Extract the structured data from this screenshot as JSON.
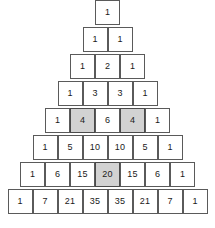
{
  "figure": {
    "name": "pascals-triangle",
    "cell_fill": "#ffffff",
    "highlight_fill": "#d2d2d2",
    "border_color": "#5a5a5a",
    "text_color": "#1a1a1a"
  },
  "chart_data": {
    "type": "table",
    "title": "",
    "rows": [
      {
        "values": [
          "1"
        ],
        "highlighted": [
          false
        ]
      },
      {
        "values": [
          "1",
          "1"
        ],
        "highlighted": [
          false,
          false
        ]
      },
      {
        "values": [
          "1",
          "2",
          "1"
        ],
        "highlighted": [
          false,
          false,
          false
        ]
      },
      {
        "values": [
          "1",
          "3",
          "3",
          "1"
        ],
        "highlighted": [
          false,
          false,
          false,
          false
        ]
      },
      {
        "values": [
          "1",
          "4",
          "6",
          "4",
          "1"
        ],
        "highlighted": [
          false,
          true,
          false,
          true,
          false
        ]
      },
      {
        "values": [
          "1",
          "5",
          "10",
          "10",
          "5",
          "1"
        ],
        "highlighted": [
          false,
          false,
          false,
          false,
          false,
          false
        ]
      },
      {
        "values": [
          "1",
          "6",
          "15",
          "20",
          "15",
          "6",
          "1"
        ],
        "highlighted": [
          false,
          false,
          false,
          true,
          false,
          false,
          false
        ]
      },
      {
        "values": [
          "1",
          "7",
          "21",
          "35",
          "35",
          "21",
          "7",
          "1"
        ],
        "highlighted": [
          false,
          false,
          false,
          false,
          false,
          false,
          false,
          false
        ]
      }
    ]
  }
}
